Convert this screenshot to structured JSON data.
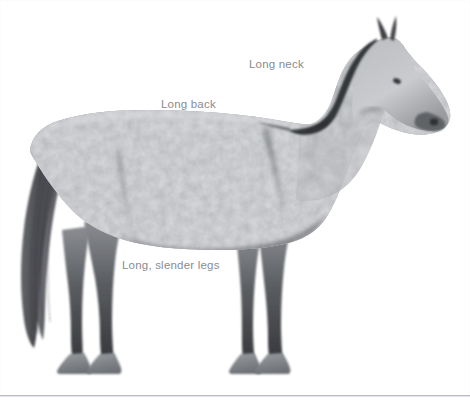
{
  "figure": {
    "background_color": "#ffffff",
    "border_color": "#b9bcc0",
    "width": 470,
    "height": 403
  },
  "annotations": [
    {
      "id": "long-neck",
      "text": "Long neck",
      "x": 249,
      "y": 59,
      "color": "#8a8c8f"
    },
    {
      "id": "long-back",
      "text": "Long back",
      "x": 161,
      "y": 99,
      "color": "#8a8c8f"
    },
    {
      "id": "long-legs",
      "text": "Long, slender legs",
      "x": 122,
      "y": 260,
      "color": "#8a8c8f"
    }
  ],
  "horse": {
    "coat": "dappled gray",
    "body_color": "#8e9094",
    "dapple_light": "#d8dade",
    "dapple_dark": "#5d6064",
    "head_color": "#c2c4c8",
    "muzzle_color": "#4a4c50",
    "mane_color": "#3a3c40",
    "tail_color": "#404247",
    "lower_leg_color": "#3b3d41",
    "hoof_color": "#82858a"
  }
}
